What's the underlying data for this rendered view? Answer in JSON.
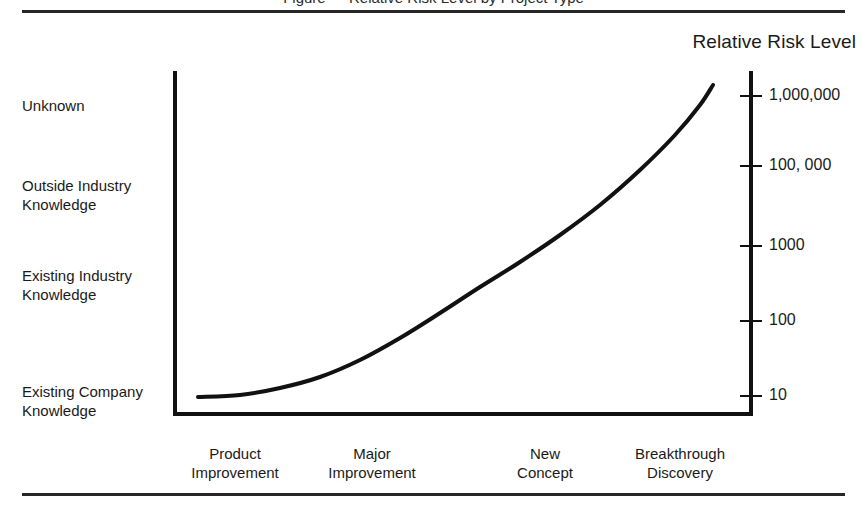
{
  "page": {
    "clipped_caption": "Figure — Relative Risk Level by Project Type",
    "background": "#ffffff",
    "ink_color": "#111111"
  },
  "chart_data": {
    "type": "line",
    "title": "Relative Risk Level",
    "xlabel": "",
    "ylabel": "",
    "grid": false,
    "legend": false,
    "categories": [
      "Product Improvement",
      "Major Improvement",
      "New Concept",
      "Breakthrough Discovery"
    ],
    "category_lines": [
      [
        "Product",
        "Improvement"
      ],
      [
        "Major",
        "Improvement"
      ],
      [
        "New",
        "Concept"
      ],
      [
        "Breakthrough",
        "Discovery"
      ]
    ],
    "left_axis_labels": [
      "Unknown",
      "Outside Industry Knowledge",
      "Existing Industry Knowledge",
      "Existing Company Knowledge"
    ],
    "left_axis_label_lines": [
      [
        "Unknown"
      ],
      [
        "Outside Industry",
        "Knowledge"
      ],
      [
        "Existing Industry",
        "Knowledge"
      ],
      [
        "Existing Company",
        "Knowledge"
      ]
    ],
    "right_axis_ticks": [
      "1,000,000",
      "100, 000",
      "1000",
      "100",
      "10"
    ],
    "right_axis_values": [
      1000000,
      100000,
      1000,
      100,
      10
    ],
    "ylim_log": [
      10,
      1000000
    ],
    "series": [
      {
        "name": "Relative Risk Level",
        "x": [
          "Product Improvement",
          "Major Improvement",
          "New Concept",
          "Breakthrough Discovery"
        ],
        "values": [
          10,
          100,
          3000,
          1500000
        ],
        "description": "Risk rises exponentially from Product Improvement to Breakthrough Discovery"
      }
    ],
    "curve_points": [
      [
        198,
        397
      ],
      [
        240,
        395
      ],
      [
        280,
        388
      ],
      [
        320,
        377
      ],
      [
        360,
        360
      ],
      [
        400,
        338
      ],
      [
        440,
        313
      ],
      [
        480,
        287
      ],
      [
        520,
        262
      ],
      [
        560,
        235
      ],
      [
        600,
        205
      ],
      [
        640,
        170
      ],
      [
        675,
        135
      ],
      [
        700,
        105
      ],
      [
        713,
        85
      ]
    ]
  },
  "labels": {
    "tick_y": [
      95,
      165,
      245,
      320,
      395
    ],
    "ylabel_top": [
      96,
      176,
      266,
      382
    ],
    "xlabel_left": [
      150,
      287,
      460,
      595
    ]
  }
}
